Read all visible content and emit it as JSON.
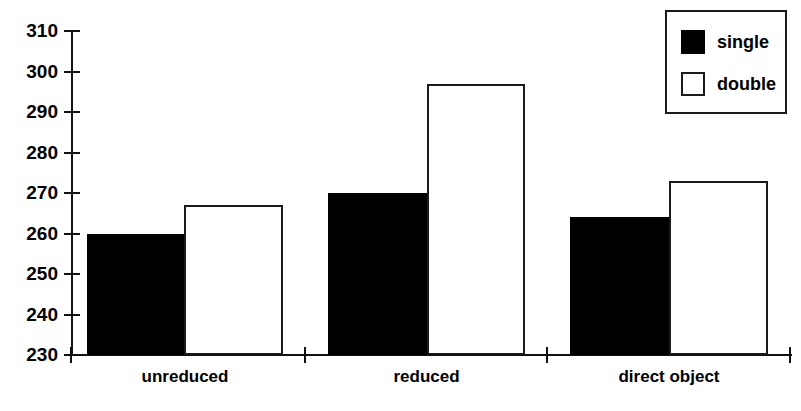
{
  "chart_data": {
    "type": "bar",
    "title": "",
    "subtitle": "",
    "xlabel": "",
    "ylabel": "",
    "categories": [
      "unreduced",
      "reduced",
      "direct object"
    ],
    "series": [
      {
        "name": "single",
        "values": [
          260,
          270,
          264
        ],
        "color": "#000000",
        "fill": "solid"
      },
      {
        "name": "double",
        "values": [
          267,
          297,
          273
        ],
        "color": "#ffffff",
        "fill": "outline"
      }
    ],
    "ylim": [
      230,
      310
    ],
    "ytick_step": 10,
    "yticks": [
      230,
      240,
      250,
      260,
      270,
      280,
      290,
      300,
      310
    ],
    "ytick_labels": [
      "230",
      "240",
      "250",
      "260",
      "270",
      "280",
      "290",
      "300",
      "310"
    ],
    "grid": false,
    "legend_position": "top-right",
    "legend_entries": [
      "single",
      "double"
    ],
    "annotations": []
  },
  "legend": {
    "entries": [
      {
        "label": "single",
        "swatch": "filled-square-icon"
      },
      {
        "label": "double",
        "swatch": "hollow-square-icon"
      }
    ]
  },
  "axes": {
    "y": {
      "ticks": [
        "310",
        "300",
        "290",
        "280",
        "270",
        "260",
        "250",
        "240",
        "230"
      ]
    },
    "x": {
      "categories": [
        "unreduced",
        "reduced",
        "direct object"
      ]
    }
  }
}
